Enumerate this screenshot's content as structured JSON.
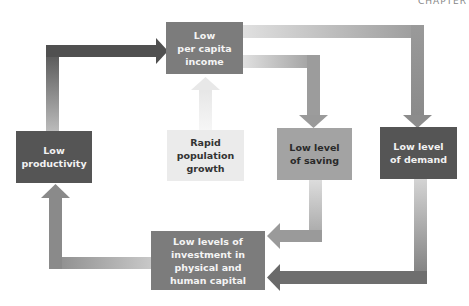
{
  "header": {
    "corner_text": "CHAPTER"
  },
  "diagram": {
    "nodes": [
      {
        "id": "income",
        "label": "Low\nper capita\nincome"
      },
      {
        "id": "productivity",
        "label": "Low\nproductivity"
      },
      {
        "id": "population",
        "label": "Rapid\npopulation\ngrowth"
      },
      {
        "id": "saving",
        "label": "Low level\nof saving"
      },
      {
        "id": "demand",
        "label": "Low level\nof demand"
      },
      {
        "id": "investment",
        "label": "Low levels of\ninvestment in\nphysical and\nhuman capital"
      }
    ],
    "edges": [
      {
        "from": "population",
        "to": "income"
      },
      {
        "from": "income",
        "to": "saving"
      },
      {
        "from": "income",
        "to": "demand"
      },
      {
        "from": "saving",
        "to": "investment"
      },
      {
        "from": "demand",
        "to": "investment"
      },
      {
        "from": "investment",
        "to": "productivity"
      },
      {
        "from": "productivity",
        "to": "income"
      }
    ]
  }
}
